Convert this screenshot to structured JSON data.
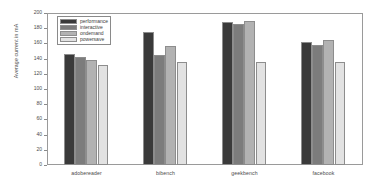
{
  "chart_data": {
    "type": "bar",
    "title": "",
    "xlabel": "",
    "ylabel": "Average current in mA",
    "ylim": [
      0,
      200
    ],
    "yticks": [
      0,
      20,
      40,
      60,
      80,
      100,
      120,
      140,
      160,
      180,
      200
    ],
    "ytick_labels": [
      "0",
      "20",
      "40",
      "60",
      "80",
      "100",
      "120",
      "140",
      "160",
      "180",
      "200"
    ],
    "grid": false,
    "legend_position": "upper-left-inside",
    "categories": [
      "adobereader",
      "bibench",
      "geekbench",
      "facebook"
    ],
    "series": [
      {
        "name": "performance",
        "color": "#3a3a3a",
        "values": [
          146,
          175,
          188,
          162
        ]
      },
      {
        "name": "interactive",
        "color": "#7c7c7c",
        "values": [
          142,
          145,
          185,
          158
        ]
      },
      {
        "name": "ondemand",
        "color": "#b2b2b2",
        "values": [
          138,
          156,
          190,
          165
        ]
      },
      {
        "name": "powersave",
        "color": "#e2e2e2",
        "values": [
          131,
          135,
          135,
          135
        ]
      }
    ]
  },
  "figure": {
    "background_color": "#ffffff",
    "axes_color": "#9a9a9a",
    "text_color": "#4a4a4a"
  }
}
